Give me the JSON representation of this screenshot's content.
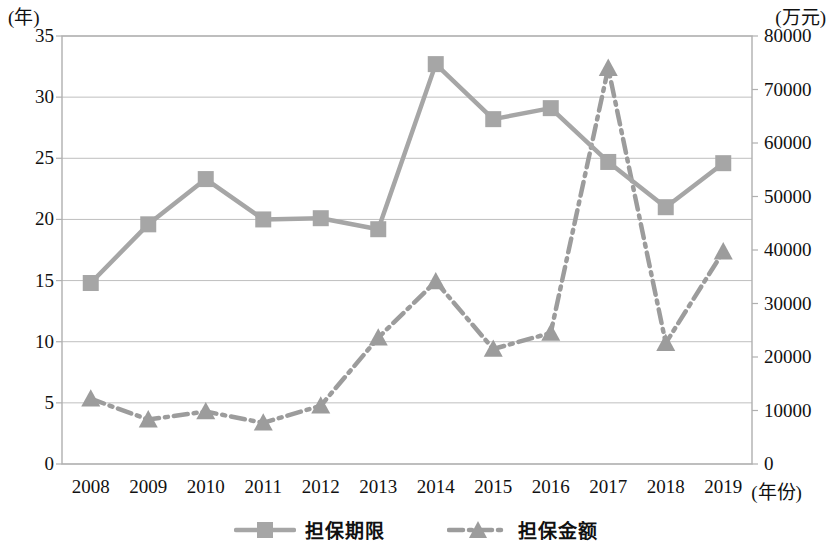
{
  "chart_data": {
    "type": "line",
    "title": "",
    "xlabel": "(年份)",
    "categories": [
      "2008",
      "2009",
      "2010",
      "2011",
      "2012",
      "2013",
      "2014",
      "2015",
      "2016",
      "2017",
      "2018",
      "2019"
    ],
    "grid": true,
    "legend_position": "bottom",
    "axes": {
      "left": {
        "unit": "(年)",
        "ticks": [
          "0",
          "5",
          "10",
          "15",
          "20",
          "25",
          "30",
          "35"
        ],
        "tick_values": [
          0,
          5,
          10,
          15,
          20,
          25,
          30,
          35
        ],
        "min": 0,
        "max": 35
      },
      "right": {
        "unit": "(万元)",
        "ticks": [
          "0",
          "10000",
          "20000",
          "30000",
          "40000",
          "50000",
          "60000",
          "70000",
          "80000"
        ],
        "tick_values": [
          0,
          10000,
          20000,
          30000,
          40000,
          50000,
          60000,
          70000,
          80000
        ],
        "min": 0,
        "max": 80000
      }
    },
    "series": [
      {
        "name": "担保期限",
        "axis": "left",
        "marker": "square",
        "line_style": "solid",
        "color": "#a6a6a6",
        "values": [
          14.8,
          19.6,
          23.3,
          20.0,
          20.1,
          19.2,
          32.7,
          28.2,
          29.1,
          24.7,
          21.0,
          24.6
        ]
      },
      {
        "name": "担保金额",
        "axis": "right",
        "marker": "triangle",
        "line_style": "dash-dot",
        "color": "#9c9c9c",
        "values": [
          12200,
          8300,
          9800,
          7700,
          10900,
          23600,
          34100,
          21500,
          24500,
          74000,
          22600,
          39700
        ]
      }
    ]
  },
  "legend": {
    "items": [
      {
        "label": "担保期限",
        "marker": "square",
        "line_style": "solid"
      },
      {
        "label": "担保金额",
        "marker": "triangle",
        "line_style": "dash-dot"
      }
    ]
  },
  "colors": {
    "series1": "#a6a6a6",
    "series2": "#9c9c9c",
    "grid": "#bfbfbf",
    "frame": "#b0b0b0",
    "text": "#111111"
  }
}
